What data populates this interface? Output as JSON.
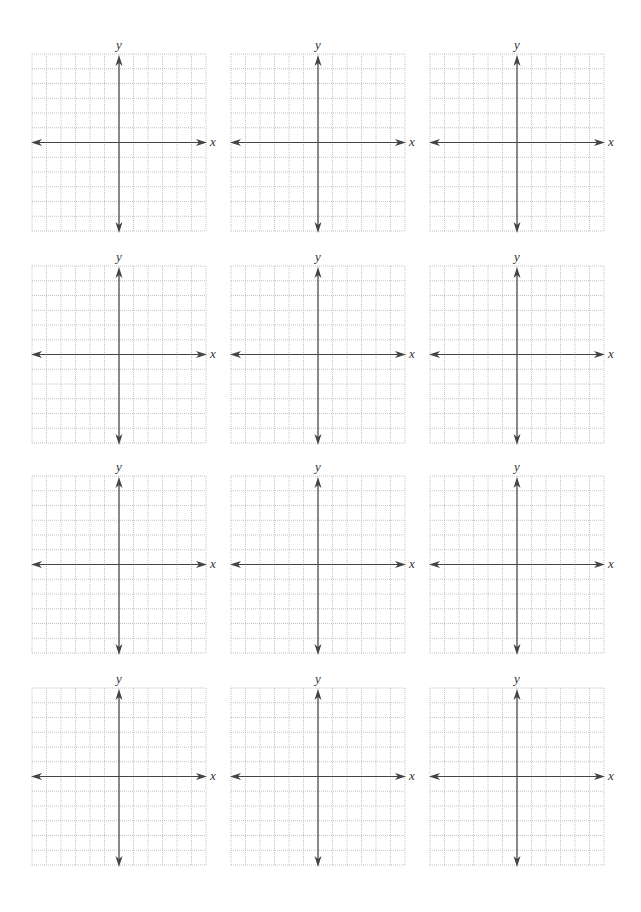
{
  "worksheet": {
    "grid": {
      "columns": 12,
      "rows": 12,
      "grid_line_color": "#b5b5b5",
      "axis_color": "#444444",
      "label_color": "#333333"
    },
    "axis_labels": {
      "x": "x",
      "y": "y"
    },
    "layout": {
      "col_left": [
        32,
        231,
        430
      ],
      "row_top": [
        54,
        266,
        476,
        688
      ],
      "width": 174,
      "height": 177
    },
    "graphs": [
      {
        "id": 1,
        "x_label": "x",
        "y_label": "y"
      },
      {
        "id": 2,
        "x_label": "x",
        "y_label": "y"
      },
      {
        "id": 3,
        "x_label": "x",
        "y_label": "y"
      },
      {
        "id": 4,
        "x_label": "x",
        "y_label": "y"
      },
      {
        "id": 5,
        "x_label": "x",
        "y_label": "y"
      },
      {
        "id": 6,
        "x_label": "x",
        "y_label": "y"
      },
      {
        "id": 7,
        "x_label": "x",
        "y_label": "y"
      },
      {
        "id": 8,
        "x_label": "x",
        "y_label": "y"
      },
      {
        "id": 9,
        "x_label": "x",
        "y_label": "y"
      },
      {
        "id": 10,
        "x_label": "x",
        "y_label": "y"
      },
      {
        "id": 11,
        "x_label": "x",
        "y_label": "y"
      },
      {
        "id": 12,
        "x_label": "x",
        "y_label": "y"
      }
    ]
  }
}
